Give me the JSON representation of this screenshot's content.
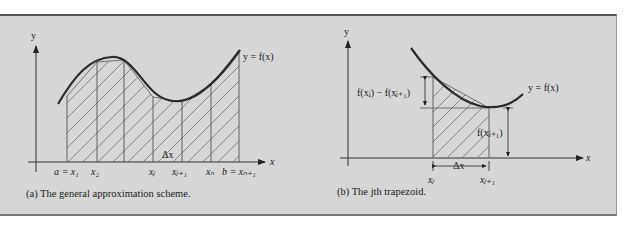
{
  "colors": {
    "panel_bg": "#d6d6d6",
    "curve": "#2b2b2b",
    "lines": "#555555",
    "hatch": "#555555"
  },
  "figure_a": {
    "caption": "(a) The general approximation scheme.",
    "y_axis_label": "y",
    "x_axis_label": "x",
    "curve_label": "y = f(x)",
    "delta_label": "Δx",
    "tick_labels": [
      "a = x₁",
      "x₂",
      "xⱼ",
      "xⱼ₊₁",
      "xₙ",
      "b = xₙ₊₁"
    ]
  },
  "figure_b": {
    "caption": "(b) The jth trapezoid.",
    "y_axis_label": "y",
    "x_axis_label": "x",
    "curve_label": "y = f(x)",
    "diff_label": "f(xⱼ) − f(xⱼ₊₁)",
    "height_label": "f(xⱼ₊₁)",
    "delta_label": "Δx",
    "tick_labels": [
      "xⱼ",
      "xⱼ₊₁"
    ]
  }
}
